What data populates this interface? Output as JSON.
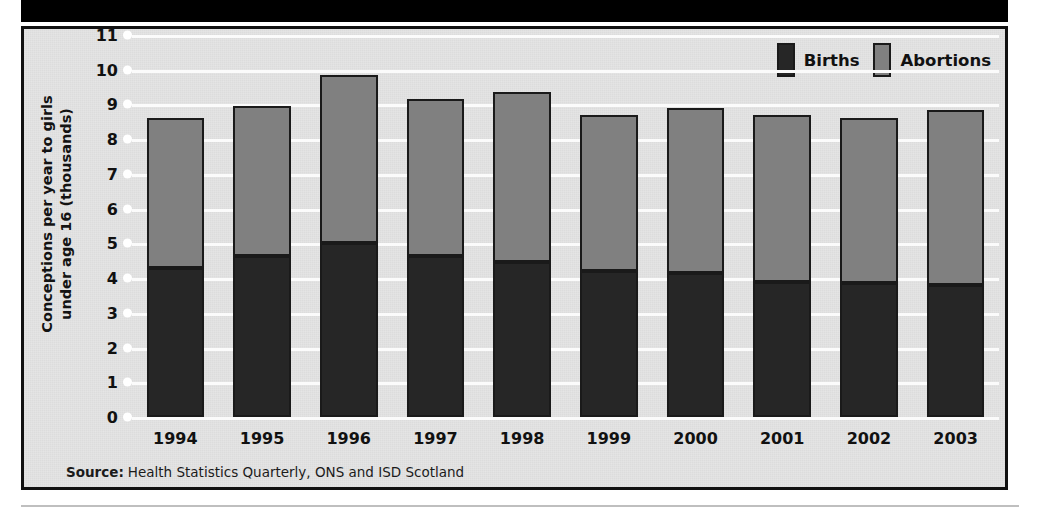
{
  "header": {
    "title": "increased number of abortions."
  },
  "legend": {
    "position": "top-right",
    "items": [
      {
        "label": "Births",
        "color": "#262626",
        "icon": "legend-swatch"
      },
      {
        "label": "Abortions",
        "color": "#808080",
        "icon": "legend-swatch"
      }
    ]
  },
  "source": {
    "label": "Source:",
    "text": "Health Statistics Quarterly, ONS and ISD Scotland"
  },
  "axes": {
    "ylabel_line1": "Conceptions per year to girls",
    "ylabel_line2": "under age 16 (thousands)",
    "yticks": [
      "11",
      "10",
      "9",
      "8",
      "7",
      "6",
      "5",
      "4",
      "3",
      "2",
      "1",
      "0"
    ]
  },
  "colors": {
    "births": "#262626",
    "abortions": "#808080",
    "plot_background": "#e4e4e4",
    "gridline": "#fbfbfb",
    "frame": "#111111",
    "title_band": "#000000"
  },
  "chart_data": {
    "type": "bar",
    "stacked": true,
    "title": "increased number of abortions.",
    "xlabel": "",
    "ylabel": "Conceptions per year to girls under age 16 (thousands)",
    "ylim": [
      0,
      11
    ],
    "ytick_step": 1,
    "grid": true,
    "legend_position": "top-right",
    "categories": [
      "1994",
      "1995",
      "1996",
      "1997",
      "1998",
      "1999",
      "2000",
      "2001",
      "2002",
      "2003"
    ],
    "series": [
      {
        "name": "Births",
        "color": "#262626",
        "values": [
          4.3,
          4.65,
          5.0,
          4.65,
          4.45,
          4.2,
          4.15,
          3.9,
          3.85,
          3.8
        ]
      },
      {
        "name": "Abortions",
        "color": "#808080",
        "values": [
          4.3,
          4.3,
          4.85,
          4.5,
          4.9,
          4.5,
          4.75,
          4.8,
          4.75,
          5.05
        ]
      }
    ],
    "totals": [
      8.6,
      8.95,
      9.85,
      9.15,
      9.35,
      8.7,
      8.9,
      8.7,
      8.6,
      8.85
    ],
    "units": "thousands",
    "source": "Health Statistics Quarterly, ONS and ISD Scotland"
  }
}
